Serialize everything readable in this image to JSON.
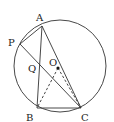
{
  "diagram": {
    "title": "",
    "circle": {
      "center": "O",
      "cx": 60,
      "cy": 66,
      "r": 46,
      "stroke": "#333333"
    },
    "points": {
      "A": {
        "x": 42,
        "y": 26,
        "label": "A",
        "lx": 36,
        "ly": 21
      },
      "P": {
        "x": 20,
        "y": 44,
        "label": "P",
        "lx": 8,
        "ly": 46
      },
      "Q": {
        "x": 40,
        "y": 65,
        "label": "Q",
        "lx": 28,
        "ly": 72
      },
      "O": {
        "x": 58,
        "y": 68,
        "label": "O",
        "lx": 49,
        "ly": 66
      },
      "B": {
        "x": 37,
        "y": 108,
        "label": "B",
        "lx": 26,
        "ly": 121
      },
      "C": {
        "x": 81,
        "y": 108,
        "label": "C",
        "lx": 81,
        "ly": 121
      }
    },
    "solid_segments": [
      [
        "A",
        "P"
      ],
      [
        "A",
        "B"
      ],
      [
        "A",
        "C"
      ],
      [
        "B",
        "C"
      ],
      [
        "P",
        "C"
      ]
    ],
    "dashed_segments": [
      [
        "O",
        "B"
      ],
      [
        "O",
        "C"
      ]
    ],
    "colors": {
      "line": "#333333",
      "label": "#222222",
      "background": "#ffffff"
    }
  }
}
